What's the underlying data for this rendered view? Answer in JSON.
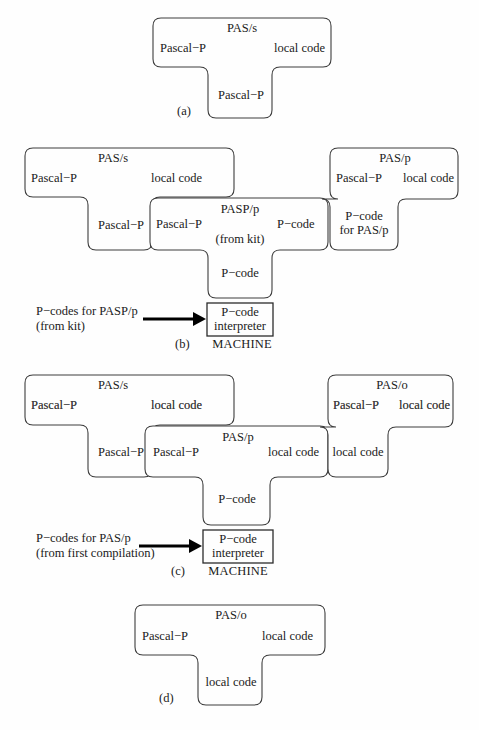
{
  "figure": {
    "background": "#fefefe",
    "stroke": "#3c3c3c"
  },
  "panels": [
    {
      "tag": "(a)",
      "tshapes": [
        {
          "name": "pas-s-compiler",
          "top": "PAS/s",
          "left": "Pascal−P",
          "right": "local code",
          "stem": "Pascal−P"
        }
      ]
    },
    {
      "tag": "(b)",
      "tshapes": [
        {
          "name": "pas-s-compiler",
          "top": "PAS/s",
          "left": "Pascal−P",
          "right": "local code",
          "stem": "Pascal−P"
        },
        {
          "name": "pasp-p-kit-compiler",
          "top": "PASP/p",
          "top2": "(from kit)",
          "left": "Pascal−P",
          "right": "P−code",
          "stem": "P−code"
        },
        {
          "name": "pas-p-compiler",
          "top": "PAS/p",
          "left": "Pascal−P",
          "right": "local code",
          "stem": "P−code",
          "stem2": "for PAS/p"
        }
      ],
      "machine": {
        "box_line1": "P−code",
        "box_line2": "interpreter",
        "caption": "MACHINE",
        "input_line1": "P−codes for PASP/p",
        "input_line2": "(from kit)"
      }
    },
    {
      "tag": "(c)",
      "tshapes": [
        {
          "name": "pas-s-compiler",
          "top": "PAS/s",
          "left": "Pascal−P",
          "right": "local code",
          "stem": "Pascal−P"
        },
        {
          "name": "pas-p-compiler",
          "top": "PAS/p",
          "left": "Pascal−P",
          "right": "local code",
          "stem": "P−code"
        },
        {
          "name": "pas-o-compiler",
          "top": "PAS/o",
          "left": "Pascal−P",
          "right": "local code",
          "stem": "local code"
        }
      ],
      "machine": {
        "box_line1": "P−code",
        "box_line2": "interpreter",
        "caption": "MACHINE",
        "input_line1": "P−codes for PAS/p",
        "input_line2": "(from first compilation)"
      }
    },
    {
      "tag": "(d)",
      "tshapes": [
        {
          "name": "pas-o-compiler",
          "top": "PAS/o",
          "left": "Pascal−P",
          "right": "local code",
          "stem": "local code"
        }
      ]
    }
  ]
}
